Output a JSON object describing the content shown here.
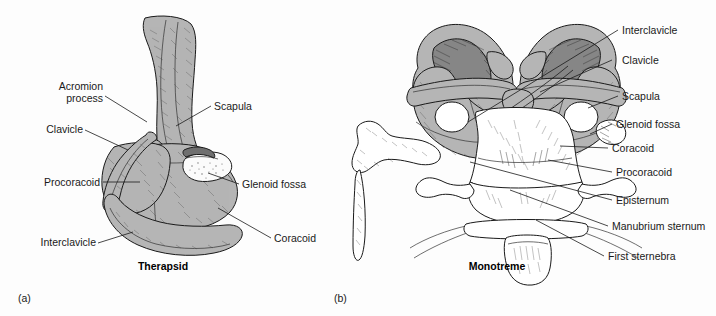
{
  "figure": {
    "background_color": "#fdfdfd",
    "bone_fill_gray": "#b5b5b5",
    "bone_fill_dark": "#8d8d8d",
    "bone_fill_white": "#ffffff",
    "outline_color": "#1a1a1a",
    "label_color": "#1a1a1a"
  },
  "panel_a": {
    "id": "(a)",
    "caption": "Therapsid",
    "labels": {
      "acromion_line1": "Acromion",
      "acromion_line2": "process",
      "clavicle": "Clavicle",
      "procoracoid": "Procoracoid",
      "interclavicle": "Interclavicle",
      "scapula": "Scapula",
      "glenoid_fossa": "Glenoid fossa",
      "coracoid": "Coracoid"
    }
  },
  "panel_b": {
    "id": "(b)",
    "caption": "Monotreme",
    "labels": {
      "interclavicle": "Interclavicle",
      "clavicle": "Clavicle",
      "scapula": "Scapula",
      "glenoid_fossa": "Glenoid fossa",
      "coracoid": "Coracoid",
      "procoracoid": "Procoracoid",
      "episternum": "Episternum",
      "manubrium_sternum": "Manubrium sternum",
      "first_sternebra": "First sternebra"
    }
  }
}
